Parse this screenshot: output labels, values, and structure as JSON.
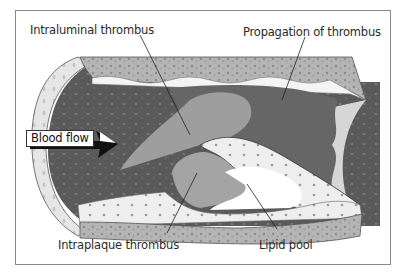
{
  "diagram": {
    "type": "illustration",
    "labels": {
      "intraluminal": "Intraluminal thrombus",
      "propagation": "Propagation of thrombus",
      "intraplaque": "Intraplaque thrombus",
      "lipid_pool": "Lipid pool",
      "blood_flow": "Blood flow"
    },
    "colors": {
      "frame": "#8a8a8a",
      "lumen_dark": "#5e5e5e",
      "propagation": "#6a6a6a",
      "thrombus_light": "#a8a8a8",
      "wall_media": "#b8b8b8",
      "wall_intima": "#ececec",
      "lipid_pool": "#ffffff",
      "arrow": "#111111"
    }
  }
}
